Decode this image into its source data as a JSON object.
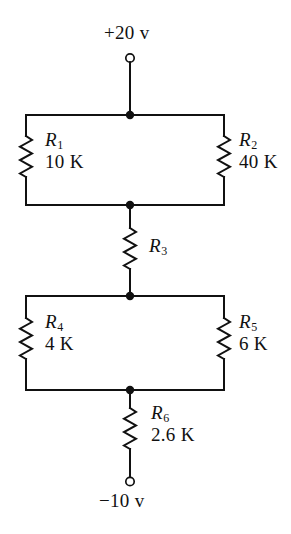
{
  "figure": {
    "type": "resistor-ladder-schematic",
    "background_color": "#ffffff",
    "line_color": "#111111"
  },
  "supplies": {
    "top": {
      "label": "+20 v",
      "terminal": "open-circle-terminal"
    },
    "bottom": {
      "label": "−10 v",
      "terminal": "open-circle-terminal"
    }
  },
  "resistors": [
    {
      "id": "R1",
      "name": "R",
      "subscript": "1",
      "value": "10 K"
    },
    {
      "id": "R2",
      "name": "R",
      "subscript": "2",
      "value": "40 K"
    },
    {
      "id": "R3",
      "name": "R",
      "subscript": "3",
      "value": ""
    },
    {
      "id": "R4",
      "name": "R",
      "subscript": "4",
      "value": "4 K"
    },
    {
      "id": "R5",
      "name": "R",
      "subscript": "5",
      "value": "6 K"
    },
    {
      "id": "R6",
      "name": "R",
      "subscript": "6",
      "value": "2.6 K"
    }
  ],
  "nodes": [
    {
      "id": "node-top",
      "x": 130,
      "y": 115
    },
    {
      "id": "node-mid-upper",
      "x": 130,
      "y": 205
    },
    {
      "id": "node-mid-lower",
      "x": 130,
      "y": 296
    },
    {
      "id": "node-bottom",
      "x": 130,
      "y": 390
    }
  ]
}
